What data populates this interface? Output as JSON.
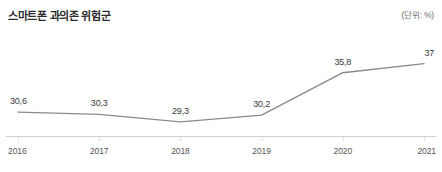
{
  "header": {
    "title": "스마트폰 과의존 위험군",
    "unit": "(단위: %)"
  },
  "chart_data": {
    "type": "line",
    "title": "스마트폰 과의존 위험군",
    "xlabel": "",
    "ylabel": "",
    "unit": "%",
    "categories": [
      "2016",
      "2017",
      "2018",
      "2019",
      "2020",
      "2021"
    ],
    "values": [
      30.6,
      30.3,
      29.3,
      30.2,
      35.8,
      37
    ],
    "point_labels": [
      "30,6",
      "30,3",
      "29,3",
      "30,2",
      "35,8",
      "37"
    ],
    "ylim": [
      28.5,
      38.0
    ],
    "grid": false,
    "legend": null,
    "markers": false,
    "line_color": "#8a8a8a",
    "axis_color": "#cfcfcf",
    "label_color": "#3a3a3a"
  },
  "axis": {
    "ticks": [
      {
        "label": "2016"
      },
      {
        "label": "2017"
      },
      {
        "label": "2018"
      },
      {
        "label": "2019"
      },
      {
        "label": "2020"
      },
      {
        "label": "2021"
      }
    ]
  },
  "colors": {
    "background": "#ffffff",
    "title": "#2b2b2b",
    "unit": "#6f6f6f",
    "line": "#8a8a8a",
    "axis": "#cfcfcf",
    "tick_label": "#555555"
  }
}
